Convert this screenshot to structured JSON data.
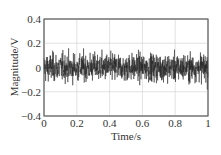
{
  "chart_data": {
    "type": "line",
    "title": "",
    "xlabel": "Time/s",
    "ylabel": "Magnitude/V",
    "xlim": [
      0,
      1
    ],
    "ylim": [
      -0.4,
      0.4
    ],
    "x_ticks": [
      "0",
      "0.2",
      "0.4",
      "0.6",
      "0.8",
      "1"
    ],
    "y_ticks": [
      "0.4",
      "0.2",
      "0",
      "-0.2",
      "-0.4"
    ],
    "grid": true,
    "legend": null,
    "series": [
      {
        "name": "signal",
        "description": "Dense noise-like vibration signal centered at 0, mostly within ±0.2 V with peaks reaching about ±0.3 V",
        "amplitude_typical": 0.18,
        "amplitude_peak": 0.3,
        "samples": 1000,
        "color": "#222222"
      }
    ]
  }
}
